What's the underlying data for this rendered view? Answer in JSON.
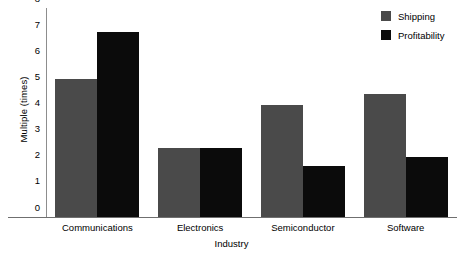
{
  "chart_data": {
    "type": "bar",
    "title": "",
    "xlabel": "Industry",
    "ylabel": "Multiple (times)",
    "categories": [
      "Communications",
      "Electronics",
      "Semiconductor",
      "Software"
    ],
    "series": [
      {
        "name": "Shipping",
        "color": "#4a4a4a",
        "values": [
          5.3,
          2.65,
          4.3,
          4.7
        ]
      },
      {
        "name": "Profitability",
        "color": "#0b0b0b",
        "values": [
          7.1,
          2.65,
          1.95,
          2.3
        ]
      }
    ],
    "ylim": [
      0,
      8
    ],
    "yticks": [
      0,
      1,
      2,
      3,
      4,
      5,
      6,
      7,
      8
    ],
    "ytick_labels": [
      "0",
      "1",
      "2",
      "3",
      "4",
      "5",
      "6",
      "7",
      "8"
    ],
    "grid": false,
    "legend_position": "top-right"
  }
}
